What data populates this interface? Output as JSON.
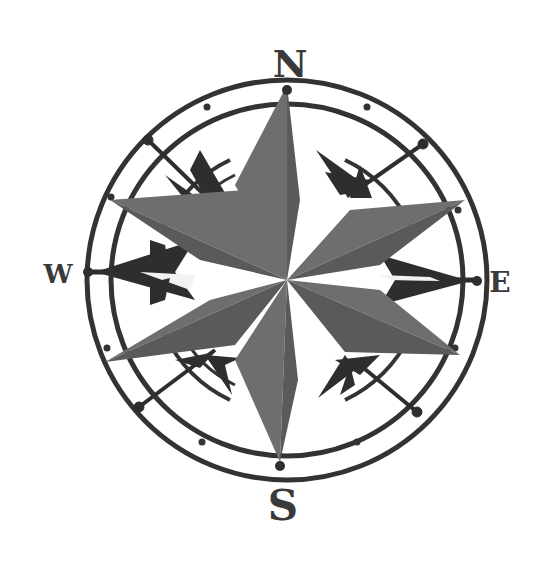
{
  "image": {
    "title": "Compass rose",
    "background": "#ffffff"
  },
  "compass": {
    "center": [
      287,
      280
    ],
    "labels": {
      "north": "N",
      "south": "S",
      "east": "E",
      "west": "W"
    },
    "colors": {
      "ring": "#333333",
      "star_points": "#6e6e6e",
      "arrows": "#2e2e2e",
      "letters": "#3a3a3a"
    }
  }
}
